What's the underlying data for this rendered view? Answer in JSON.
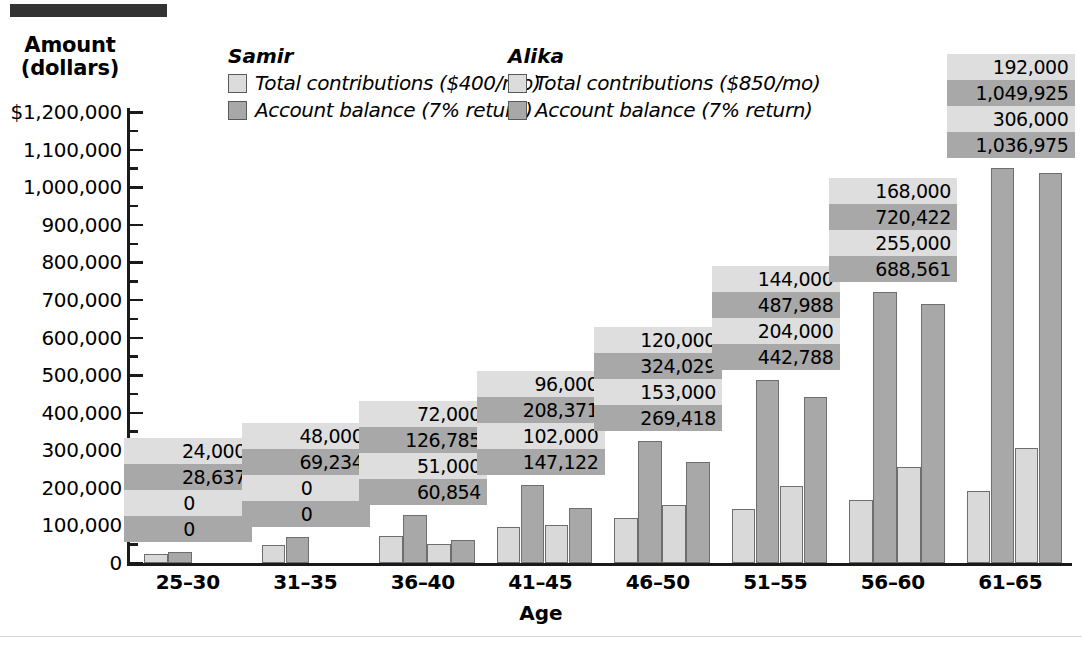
{
  "decor": {
    "top_rule": "top-black-rule",
    "bottom_rule": "bottom-hairline"
  },
  "legend": {
    "samir": {
      "title": "Samir",
      "contributions": "Total contributions ($400/mo)",
      "balance": "Account balance (7% return)"
    },
    "alika": {
      "title": "Alika",
      "contributions": "Total contributions ($850/mo)",
      "balance": "Account balance (7% return)"
    }
  },
  "chart_data": {
    "type": "bar",
    "title": "",
    "xlabel": "Age",
    "ylabel": "Amount (dollars)",
    "ylim": [
      0,
      1200000
    ],
    "ytick_values": [
      1200000,
      1100000,
      1000000,
      900000,
      800000,
      700000,
      600000,
      500000,
      400000,
      300000,
      200000,
      100000,
      0
    ],
    "ytick_labels": [
      "$1,200,000",
      "1,100,000",
      "1,000,000",
      "900,000",
      "800,000",
      "700,000",
      "600,000",
      "500,000",
      "400,000",
      "300,000",
      "200,000",
      "100,000",
      "0"
    ],
    "grid": false,
    "legend_position": "top-center",
    "categories": [
      "25–30",
      "31–35",
      "36–40",
      "41–45",
      "46–50",
      "51–55",
      "56–60",
      "61–65"
    ],
    "series": [
      {
        "name": "Samir — Total contributions ($400/mo)",
        "shade": "light",
        "values": [
          24000,
          48000,
          72000,
          96000,
          120000,
          144000,
          168000,
          192000
        ],
        "labels": [
          "24,000",
          "48,000",
          "72,000",
          "96,000",
          "120,000",
          "144,000",
          "168,000",
          "192,000"
        ]
      },
      {
        "name": "Samir — Account balance (7% return)",
        "shade": "dark",
        "values": [
          28637,
          69234,
          126785,
          208371,
          324029,
          487988,
          720422,
          1049925
        ],
        "labels": [
          "28,637",
          "69,234",
          "126,785",
          "208,371",
          "324,029",
          "487,988",
          "720,422",
          "1,049,925"
        ]
      },
      {
        "name": "Alika — Total contributions ($850/mo)",
        "shade": "light",
        "values": [
          0,
          0,
          51000,
          102000,
          153000,
          204000,
          255000,
          306000
        ],
        "labels": [
          "0",
          "0",
          "51,000",
          "102,000",
          "153,000",
          "204,000",
          "255,000",
          "306,000"
        ]
      },
      {
        "name": "Alika — Account balance (7% return)",
        "shade": "dark",
        "values": [
          0,
          0,
          60854,
          147122,
          269418,
          442788,
          688561,
          1036975
        ],
        "labels": [
          "0",
          "0",
          "60,854",
          "147,122",
          "269,418",
          "442,788",
          "688,561",
          "1,036,975"
        ]
      }
    ]
  }
}
